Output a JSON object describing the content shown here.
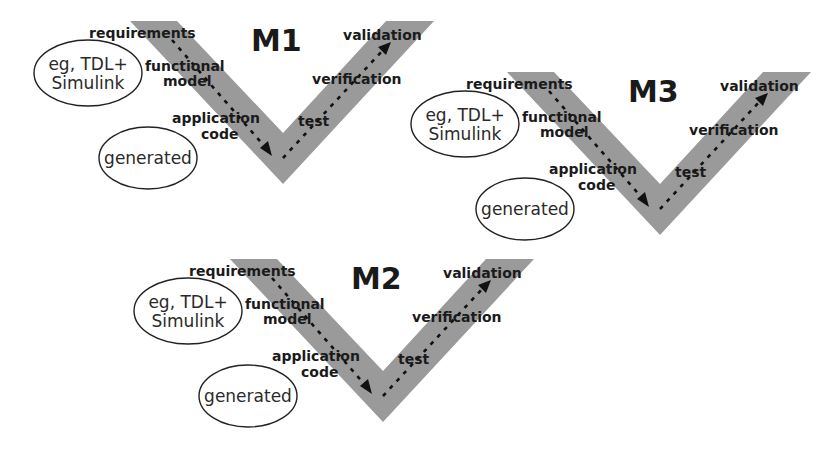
{
  "diagram": {
    "colors": {
      "v_band": "#9a9a9a",
      "text": "#1a1a1a",
      "background": "#ffffff"
    },
    "blocks": [
      {
        "title": "M1",
        "left_labels": {
          "top": "requirements",
          "mid1": "functional",
          "mid2": "model",
          "low1": "application",
          "low2": "code"
        },
        "right_labels": {
          "top": "validation",
          "mid": "verification",
          "low": "test"
        },
        "ellipse_top": {
          "line1": "eg, TDL+",
          "line2": "Simulink"
        },
        "ellipse_bottom": {
          "text": "generated"
        }
      },
      {
        "title": "M3",
        "left_labels": {
          "top": "requirements",
          "mid1": "functional",
          "mid2": "model",
          "low1": "application",
          "low2": "code"
        },
        "right_labels": {
          "top": "validation",
          "mid": "verification",
          "low": "test"
        },
        "ellipse_top": {
          "line1": "eg, TDL+",
          "line2": "Simulink"
        },
        "ellipse_bottom": {
          "text": "generated"
        }
      },
      {
        "title": "M2",
        "left_labels": {
          "top": "requirements",
          "mid1": "functional",
          "mid2": "model",
          "low1": "application",
          "low2": "code"
        },
        "right_labels": {
          "top": "validation",
          "mid": "verification",
          "low": "test"
        },
        "ellipse_top": {
          "line1": "eg, TDL+",
          "line2": "Simulink"
        },
        "ellipse_bottom": {
          "text": "generated"
        }
      }
    ]
  }
}
